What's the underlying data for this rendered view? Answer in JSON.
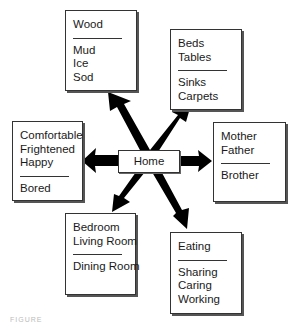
{
  "diagram": {
    "center": {
      "label": "Home"
    },
    "nodes": [
      {
        "id": "materials",
        "above": [
          "Wood"
        ],
        "below": [
          "Mud",
          "Ice",
          "Sod"
        ]
      },
      {
        "id": "furnishings",
        "above": [
          "Beds",
          "Tables"
        ],
        "below": [
          "Sinks",
          "Carpets"
        ]
      },
      {
        "id": "feelings",
        "above": [
          "Comfortable",
          "Frightened",
          "Happy"
        ],
        "below": [
          "Bored"
        ]
      },
      {
        "id": "family",
        "above": [
          "Mother",
          "Father"
        ],
        "below": [
          "Brother"
        ]
      },
      {
        "id": "rooms",
        "above": [
          "Bedroom",
          "Living Room"
        ],
        "below": [
          "Dining Room"
        ]
      },
      {
        "id": "activities",
        "above": [
          "Eating"
        ],
        "below": [
          "Sharing",
          "Caring",
          "Working"
        ]
      }
    ],
    "arrow_color": "#000000",
    "caption": "FIGURE"
  }
}
